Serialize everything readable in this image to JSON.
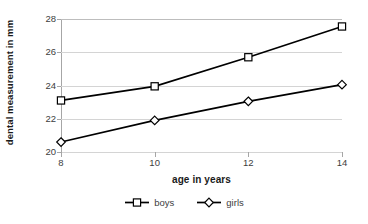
{
  "chart_data": {
    "type": "line",
    "title": "",
    "xlabel": "age in years",
    "ylabel": "dental measurement in mm",
    "categories": [
      "8",
      "10",
      "12",
      "14"
    ],
    "x": [
      8,
      10,
      12,
      14
    ],
    "xlim": [
      8,
      14
    ],
    "ylim": [
      20,
      28
    ],
    "yticks": [
      "20",
      "22",
      "24",
      "26",
      "28"
    ],
    "ytick_values": [
      20,
      22,
      24,
      26,
      28
    ],
    "grid": "horizontal",
    "legend_position": "bottom",
    "series": [
      {
        "name": "boys",
        "values": [
          23.1,
          23.95,
          25.7,
          27.55
        ],
        "marker": "square",
        "color": "#000000"
      },
      {
        "name": "girls",
        "values": [
          20.6,
          21.9,
          23.05,
          24.05
        ],
        "marker": "diamond",
        "color": "#000000"
      }
    ]
  },
  "legend": {
    "items": [
      {
        "label": "boys",
        "marker": "square-marker-icon"
      },
      {
        "label": "girls",
        "marker": "diamond-marker-icon"
      }
    ]
  },
  "colors": {
    "line": "#000000",
    "grid": "#d4d4d4",
    "axis": "#a6a6a6",
    "text": "#3d3d3d",
    "marker_fill": "#ffffff",
    "background": "#ffffff"
  }
}
